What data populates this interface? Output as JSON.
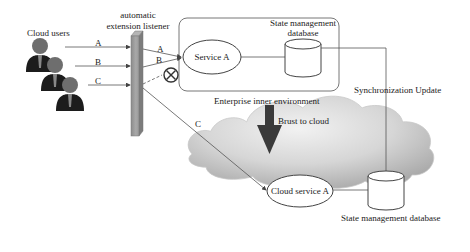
{
  "diagram": {
    "users": {
      "label": "Cloud users",
      "count": 3
    },
    "listener": {
      "label_line1": "automatic",
      "label_line2": "extension listener"
    },
    "request_labels": {
      "a_in": "A",
      "b_in": "B",
      "c_in": "C",
      "a_out": "A",
      "b_out": "B",
      "c_out": "C"
    },
    "enterprise": {
      "label": "Enterprise inner environment",
      "service": "Service A",
      "database_line1": "State management",
      "database_line2": "database"
    },
    "blocked_icon": "circle-x-icon",
    "burst_label": "Brust to cloud",
    "sync_label": "Synchronization Update",
    "cloud": {
      "service": "Cloud service A",
      "database": "State management database"
    },
    "colors": {
      "line": "#555555",
      "listener_bar": "#9a9a9a",
      "arrow_dark": "#3a3a3a",
      "cloud_light": "#e6e6e6",
      "cloud_dark": "#a8a8a8"
    }
  }
}
